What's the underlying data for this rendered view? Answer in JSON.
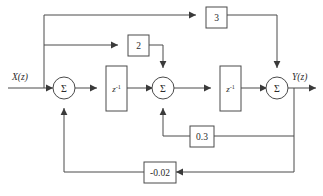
{
  "diagram": {
    "type": "signal-flow-block-diagram",
    "title": "",
    "input_label": "X(z)",
    "output_label": "Y(z)",
    "summers": [
      {
        "id": "sum1",
        "symbol": "Σ",
        "cx": 64,
        "cy": 88,
        "r": 11
      },
      {
        "id": "sum2",
        "symbol": "Σ",
        "cx": 163,
        "cy": 88,
        "r": 11
      },
      {
        "id": "sum3",
        "symbol": "Σ",
        "cx": 277,
        "cy": 88,
        "r": 11
      }
    ],
    "delays": [
      {
        "id": "delay1",
        "base": "z",
        "exponent": "-1",
        "x": 106,
        "y": 66,
        "w": 21,
        "h": 45
      },
      {
        "id": "delay2",
        "base": "z",
        "exponent": "-1",
        "x": 220,
        "y": 66,
        "w": 21,
        "h": 45
      }
    ],
    "gains": [
      {
        "id": "gain-3",
        "value": "3",
        "x": 206,
        "y": 7,
        "w": 21,
        "h": 21
      },
      {
        "id": "gain-2",
        "value": "2",
        "x": 128,
        "y": 35,
        "w": 21,
        "h": 21
      },
      {
        "id": "gain-0p3",
        "value": "0.3",
        "x": 190,
        "y": 126,
        "w": 24,
        "h": 21
      },
      {
        "id": "gain-m0p02",
        "value": "-0.02",
        "x": 144,
        "y": 162,
        "w": 32,
        "h": 21
      }
    ],
    "paths": [
      {
        "id": "feedforward-3",
        "from": "input",
        "through": "gain-3",
        "to": "sum3"
      },
      {
        "id": "feedforward-2",
        "from": "input",
        "through": "gain-2",
        "to": "sum2"
      },
      {
        "id": "feedback-0.3",
        "from": "output",
        "through": "gain-0p3",
        "to": "sum2"
      },
      {
        "id": "feedback--0.02",
        "from": "output",
        "through": "gain-m0p02",
        "to": "sum1"
      },
      {
        "id": "forward-main",
        "from": "input",
        "through": "sum1-delay1-sum2-delay2-sum3",
        "to": "output"
      }
    ],
    "colors": {
      "line": "#4a4a4a",
      "text": "#2b2b2b",
      "background": "#ffffff",
      "arrow": "#3a3a3a"
    }
  }
}
